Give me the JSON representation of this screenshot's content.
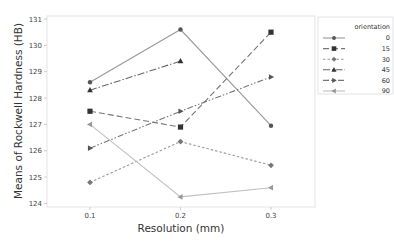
{
  "chart_data": {
    "type": "line",
    "title": "",
    "xlabel": "Resolution (mm)",
    "ylabel": "Means of Rockwell Hardness (HB)",
    "x": [
      "0.1",
      "0.2",
      "0.3"
    ],
    "yticks": [
      "124",
      "125",
      "126",
      "127",
      "128",
      "129",
      "130",
      "131"
    ],
    "ylim": [
      124,
      131
    ],
    "grid": false,
    "legend_title": "orientation",
    "legend_position": "right",
    "series": [
      {
        "name": "0",
        "values": [
          128.6,
          130.6,
          126.95
        ],
        "marker": "circle",
        "line": "solid",
        "color": "#999999",
        "marker_color": "#555555"
      },
      {
        "name": "15",
        "values": [
          127.5,
          126.9,
          130.5
        ],
        "marker": "square",
        "line": "long-dash",
        "color": "#777777",
        "marker_color": "#333333"
      },
      {
        "name": "30",
        "values": [
          124.8,
          126.35,
          125.45
        ],
        "marker": "diamond",
        "line": "short-dash",
        "color": "#999999",
        "marker_color": "#777777"
      },
      {
        "name": "45",
        "values": [
          128.3,
          129.4,
          null
        ],
        "marker": "triangle-up",
        "line": "dash-dot",
        "color": "#666666",
        "marker_color": "#333333"
      },
      {
        "name": "60",
        "values": [
          126.1,
          127.5,
          128.8
        ],
        "marker": "triangle-right",
        "line": "dash-dot-dot",
        "color": "#777777",
        "marker_color": "#555555"
      },
      {
        "name": "90",
        "values": [
          127.0,
          124.25,
          124.6
        ],
        "marker": "triangle-left",
        "line": "solid",
        "color": "#c0c0c0",
        "marker_color": "#999999"
      }
    ]
  }
}
